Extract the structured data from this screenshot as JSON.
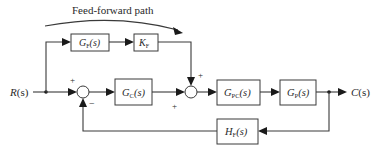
{
  "diagram": {
    "title": "Feed-forward path",
    "input": {
      "label": "R(s)",
      "main": "R",
      "arg": "(s)"
    },
    "output": {
      "label": "C(s)",
      "main": "C",
      "arg": "(s)"
    },
    "blocks": [
      {
        "id": "gf",
        "label": "GF(s)",
        "main": "G",
        "sub": "F",
        "arg": "(s)",
        "role": "feed-forward transfer function"
      },
      {
        "id": "kf",
        "label": "KF",
        "main": "K",
        "sub": "F",
        "arg": "",
        "role": "feed-forward gain"
      },
      {
        "id": "gc",
        "label": "GC(s)",
        "main": "G",
        "sub": "C",
        "arg": "(s)",
        "role": "controller"
      },
      {
        "id": "gpc",
        "label": "GPC(s)",
        "main": "G",
        "sub": "PC",
        "arg": "(s)",
        "role": "power converter"
      },
      {
        "id": "gp",
        "label": "GP(s)",
        "main": "G",
        "sub": "P",
        "arg": "(s)",
        "role": "plant"
      },
      {
        "id": "hf",
        "label": "HF(s)",
        "main": "H",
        "sub": "F",
        "arg": "(s)",
        "role": "feedback"
      }
    ],
    "summing_junctions": [
      {
        "id": "sum1",
        "signs": {
          "left": "+",
          "bottom": "−"
        }
      },
      {
        "id": "sum2",
        "signs": {
          "top": "+",
          "left": "+"
        }
      }
    ],
    "connections": [
      "R(s) -> branch",
      "branch -> GF(s)",
      "GF(s) -> KF",
      "KF -> sum2 (+)",
      "branch -> sum1 (+)",
      "sum1 -> GC(s)",
      "GC(s) -> sum2 (+)",
      "sum2 -> GPC(s)",
      "GPC(s) -> GP(s)",
      "GP(s) -> C(s)",
      "C(s) -> HF(s)",
      "HF(s) -> sum1 (−)"
    ],
    "colors": {
      "line": "#3a3a3a",
      "text": "#2a2a2a",
      "background": "#ffffff"
    }
  }
}
